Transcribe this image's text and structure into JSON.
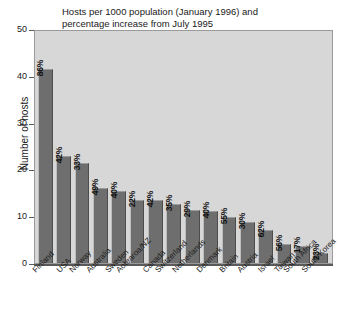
{
  "chart_data": {
    "type": "bar",
    "title": "Hosts per 1000 population (January 1996) and percentage increase from July 1995",
    "xlabel": "",
    "ylabel": "Number of hosts",
    "ylim": [
      0,
      50
    ],
    "yticks": [
      0,
      10,
      20,
      30,
      40,
      50
    ],
    "grid": false,
    "legend": "none",
    "categories": [
      "Finland",
      "USA",
      "Norway",
      "Australia",
      "Sweden",
      "Aotearoa/NZ",
      "Canada",
      "Switzerland",
      "Netherlands",
      "Denmark",
      "Britain",
      "Austria",
      "Israel",
      "Taiwan",
      "South Africa",
      "South Korea"
    ],
    "values": [
      41.5,
      22.8,
      21.4,
      16.0,
      15.3,
      13.5,
      13.5,
      12.6,
      11.4,
      11.2,
      9.8,
      8.8,
      7.0,
      4.0,
      3.6,
      2.2
    ],
    "bar_labels": [
      "86%",
      "42%",
      "33%",
      "49%",
      "40%",
      "22%",
      "42%",
      "35%",
      "29%",
      "40%",
      "55%",
      "30%",
      "62%",
      "56%",
      "17%",
      "23%"
    ],
    "series": [
      {
        "name": "Hosts per 1000 population",
        "values": [
          41.5,
          22.8,
          21.4,
          16.0,
          15.3,
          13.5,
          13.5,
          12.6,
          11.4,
          11.2,
          9.8,
          8.8,
          7.0,
          4.0,
          3.6,
          2.2
        ]
      },
      {
        "name": "Percentage increase from July 1995",
        "values": [
          86,
          42,
          33,
          49,
          40,
          22,
          42,
          35,
          29,
          40,
          55,
          30,
          62,
          56,
          17,
          23
        ]
      }
    ]
  },
  "colors": {
    "bar_fill": "#6e6e6e",
    "plot_background": "#d7d7d7",
    "axis": "#5a5a5a",
    "text": "#1a1a1a",
    "figure_background": "#ffffff"
  }
}
